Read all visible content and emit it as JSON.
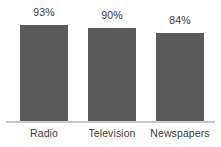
{
  "chart_data": {
    "type": "bar",
    "title": "",
    "subtitle": "",
    "xlabel": "",
    "ylabel": "",
    "categories": [
      "Radio",
      "Television",
      "Newspapers"
    ],
    "values": [
      93,
      90,
      84
    ],
    "value_labels": [
      "93%",
      "90%",
      "84%"
    ],
    "unit": "%",
    "ylim": [
      0,
      100
    ],
    "grid": false,
    "legend": false,
    "legend_position": "none",
    "orientation": "vertical",
    "axis_visible": {
      "x": true,
      "y": false
    },
    "data_labels_position": "above-bar"
  },
  "style": {
    "bar_color": "#5a5a5a",
    "text_color": "#3a3a3a",
    "axis_color": "#c9c9c9",
    "background": "#ffffff"
  },
  "bars": [
    {
      "category": "Radio",
      "value": 93,
      "label": "93%",
      "top_px": 25,
      "height_px": 97
    },
    {
      "category": "Television",
      "value": 90,
      "label": "90%",
      "top_px": 28,
      "height_px": 94
    },
    {
      "category": "Newspapers",
      "value": 84,
      "label": "84%",
      "top_px": 33,
      "height_px": 89
    }
  ]
}
